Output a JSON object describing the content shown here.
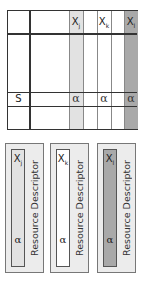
{
  "matrix": {
    "headers": [
      {
        "symbol": "X",
        "sub": "j",
        "shade": "#e2e2e2"
      },
      {
        "symbol": "X",
        "sub": "k",
        "shade": "#ffffff"
      },
      {
        "symbol": "X",
        "sub": "l",
        "shade": "#a9a9a9"
      }
    ],
    "row_label": "S",
    "row_values": [
      "α",
      "α",
      "α"
    ]
  },
  "cards": [
    {
      "symbol": "X",
      "sub": "j",
      "alpha": "α",
      "label": "Resource Descriptor",
      "strip_color": "#e2e2e2"
    },
    {
      "symbol": "X",
      "sub": "k",
      "alpha": "α",
      "label": "Resource Descriptor",
      "strip_color": "#ffffff"
    },
    {
      "symbol": "X",
      "sub": "l",
      "alpha": "α",
      "label": "Resource Descriptor",
      "strip_color": "#a9a9a9"
    }
  ]
}
